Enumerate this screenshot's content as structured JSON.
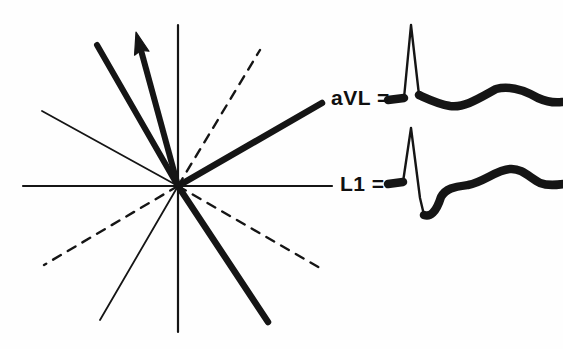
{
  "figure": {
    "background_color": "#fefefe",
    "ink_color": "#151515"
  },
  "axis_diagram": {
    "name": "hexaxial-reference-system",
    "origin": {
      "x": 178,
      "y": 186
    },
    "horizontal_axis": {
      "label": "L1 axis (0 / 180 degrees)",
      "x1": 23,
      "y1": 186,
      "x2": 332,
      "y2": 186,
      "stroke_width": 2.2,
      "style": "solid"
    },
    "vertical_axis": {
      "label": "aVF axis (+90 / -90 degrees)",
      "x1": 178,
      "y1": 25,
      "x2": 178,
      "y2": 332,
      "stroke_width": 2.2,
      "style": "solid"
    },
    "rays": [
      {
        "name": "avl-positive-ray",
        "description": "thick solid ray to upper right, lead aVL positive pole at -30 degrees",
        "x1": 178,
        "y1": 186,
        "x2": 322,
        "y2": 103,
        "stroke_width": 6.5,
        "style": "solid",
        "weight": "thick"
      },
      {
        "name": "avl-negative-ray",
        "description": "thick solid ray to lower right at +60 degrees",
        "x1": 178,
        "y1": 186,
        "x2": 268,
        "y2": 322,
        "stroke_width": 6.5,
        "style": "solid",
        "weight": "thick"
      },
      {
        "name": "mean-vector-companion-ray",
        "description": "thick solid ray to upper left, steeply negative axis",
        "x1": 178,
        "y1": 186,
        "x2": 97,
        "y2": 45,
        "stroke_width": 6.0,
        "style": "solid",
        "weight": "thick"
      },
      {
        "name": "thin-ray-upper-left",
        "description": "thin solid ray to upper left at -30 degrees",
        "x1": 178,
        "y1": 186,
        "x2": 42,
        "y2": 111,
        "stroke_width": 1.8,
        "style": "solid",
        "weight": "thin"
      },
      {
        "name": "thin-ray-lower-left",
        "description": "thin solid ray to lower left at +60 degrees",
        "x1": 178,
        "y1": 186,
        "x2": 100,
        "y2": 320,
        "stroke_width": 1.8,
        "style": "solid",
        "weight": "thin"
      },
      {
        "name": "dashed-ray-upper-right",
        "description": "dashed ray to upper right at -60 degrees",
        "x1": 178,
        "y1": 186,
        "x2": 260,
        "y2": 50,
        "stroke_width": 2.4,
        "style": "dashed",
        "weight": "thin"
      },
      {
        "name": "dashed-ray-lower-right",
        "description": "dashed ray to lower right at +30 degrees",
        "x1": 178,
        "y1": 186,
        "x2": 320,
        "y2": 268,
        "stroke_width": 2.4,
        "style": "dashed",
        "weight": "thin"
      },
      {
        "name": "dashed-ray-lower-left",
        "description": "dashed ray to lower left at +150 degrees",
        "x1": 178,
        "y1": 186,
        "x2": 44,
        "y2": 265,
        "stroke_width": 2.4,
        "style": "dashed",
        "weight": "thin"
      }
    ],
    "mean_qrs_vector": {
      "name": "mean-qrs-vector-arrow",
      "description": "thick arrow from origin pointing to upper left, representing mean QRS axis",
      "x1": 178,
      "y1": 186,
      "x2": 136,
      "y2": 32,
      "stroke_width": 6.0,
      "arrow_head_length": 22,
      "arrow_head_width": 15
    }
  },
  "tracings": [
    {
      "name": "avl-tracing",
      "label": "aVL =",
      "label_x": 331,
      "label_y": 105,
      "baseline_y": 101,
      "start_x": 392,
      "description": "tall upright R wave with small positive rounded T wave",
      "r_peak_height": 76,
      "t_wave_amplitude": 12
    },
    {
      "name": "l1-tracing",
      "label": "L1 =",
      "label_x": 340,
      "label_y": 191,
      "baseline_y": 186,
      "start_x": 392,
      "description": "tall R wave followed by deep S wave then rounded upright T wave",
      "r_peak_height": 58,
      "s_wave_depth": 29,
      "t_wave_amplitude": 16
    }
  ]
}
